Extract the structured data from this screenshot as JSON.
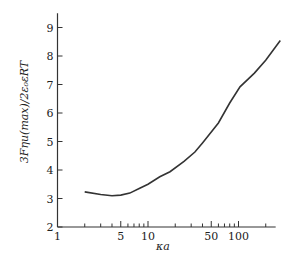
{
  "chart_data": {
    "type": "line",
    "title": "",
    "xlabel": "κa",
    "ylabel": "3Fηu(max)/2ε₀εRT",
    "xscale": "log",
    "xlim": [
      1,
      300
    ],
    "ylim": [
      2,
      9.5
    ],
    "grid": false,
    "legend": null,
    "x_ticks": [
      1,
      5,
      10,
      50,
      100
    ],
    "x_tick_labels": [
      "1",
      "5",
      "10",
      "50",
      "100"
    ],
    "x_minor_ticks": [
      2,
      3,
      4,
      6,
      7,
      8,
      9,
      20,
      30,
      40,
      60,
      70,
      80,
      90,
      200
    ],
    "y_ticks": [
      2,
      3,
      4,
      5,
      6,
      7,
      8,
      9
    ],
    "y_tick_labels": [
      "2",
      "3",
      "4",
      "5",
      "6",
      "7",
      "8",
      "9"
    ],
    "series": [
      {
        "name": "u(max)",
        "x": [
          2,
          3,
          4,
          5,
          6.3,
          8,
          10,
          13.5,
          17.5,
          25,
          33,
          40,
          60,
          80,
          104,
          150,
          200,
          290
        ],
        "y": [
          3.23,
          3.14,
          3.1,
          3.12,
          3.19,
          3.35,
          3.5,
          3.76,
          3.94,
          4.3,
          4.63,
          4.95,
          5.65,
          6.35,
          6.92,
          7.4,
          7.85,
          8.54
        ]
      }
    ]
  }
}
